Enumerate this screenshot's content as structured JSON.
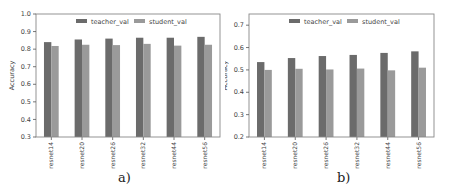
{
  "figure": {
    "captions": [
      "a)",
      "b)"
    ]
  },
  "colors": {
    "teacher": "#6b6b6b",
    "student": "#9a9a9a",
    "axis": "#555555",
    "frame": "#888888"
  },
  "chart_data": [
    {
      "type": "bar",
      "title": "",
      "caption": "a)",
      "xlabel": "",
      "ylabel": "Accuracy",
      "ylim": [
        0.3,
        1.0
      ],
      "yticks": [
        0.3,
        0.4,
        0.5,
        0.6,
        0.7,
        0.8,
        0.9,
        1.0
      ],
      "ytick_labels": [
        "0.3",
        "0.4",
        "0.5",
        "0.6",
        "0.7",
        "0.8",
        "0.9",
        "1.0"
      ],
      "categories": [
        "resnet14",
        "resnet20",
        "resnet26",
        "resnet32",
        "resnet44",
        "resnet56"
      ],
      "series": [
        {
          "name": "teacher_val",
          "values": [
            0.84,
            0.855,
            0.86,
            0.865,
            0.865,
            0.87
          ]
        },
        {
          "name": "student_val",
          "values": [
            0.818,
            0.825,
            0.823,
            0.83,
            0.82,
            0.825
          ]
        }
      ],
      "legend": {
        "position": "upper center",
        "ncol": 2,
        "entries": [
          "teacher_val",
          "student_val"
        ]
      },
      "grid": false
    },
    {
      "type": "bar",
      "title": "",
      "caption": "b)",
      "xlabel": "",
      "ylabel": "Accuracy",
      "ylim": [
        0.2,
        0.75
      ],
      "yticks": [
        0.2,
        0.3,
        0.4,
        0.5,
        0.6,
        0.7
      ],
      "ytick_labels": [
        "0.2",
        "0.3",
        "0.4",
        "0.5",
        "0.6",
        "0.7"
      ],
      "categories": [
        "resnet14",
        "resnet20",
        "resnet26",
        "resnet32",
        "resnet44",
        "resnet56"
      ],
      "series": [
        {
          "name": "teacher_val",
          "values": [
            0.535,
            0.553,
            0.562,
            0.567,
            0.576,
            0.583
          ]
        },
        {
          "name": "student_val",
          "values": [
            0.5,
            0.505,
            0.502,
            0.506,
            0.498,
            0.51
          ]
        }
      ],
      "legend": {
        "position": "upper center",
        "ncol": 2,
        "entries": [
          "teacher_val",
          "student_val"
        ]
      },
      "grid": false
    }
  ]
}
